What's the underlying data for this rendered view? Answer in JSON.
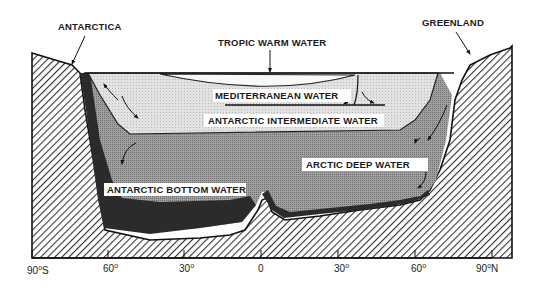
{
  "diagram": {
    "type": "ocean-circulation-cross-section",
    "landmasses": {
      "left": "ANTARCTICA",
      "right": "GREENLAND"
    },
    "water_masses": [
      {
        "id": "tropic",
        "label": "TROPIC WARM WATER"
      },
      {
        "id": "mediterranean",
        "label": "MEDITERRANEAN WATER"
      },
      {
        "id": "intermediate",
        "label": "ANTARCTIC INTERMEDIATE WATER"
      },
      {
        "id": "arctic_deep",
        "label": "ARCTIC DEEP WATER"
      },
      {
        "id": "antarctic_bottom",
        "label": "ANTARCTIC BOTTOM WATER"
      }
    ],
    "x_axis": {
      "ticks": [
        {
          "value": "90",
          "suffix": "S"
        },
        {
          "value": "60",
          "suffix": ""
        },
        {
          "value": "30",
          "suffix": ""
        },
        {
          "value": "0",
          "suffix": "",
          "no_degree": true
        },
        {
          "value": "30",
          "suffix": ""
        },
        {
          "value": "60",
          "suffix": ""
        },
        {
          "value": "90",
          "suffix": "N"
        }
      ],
      "degree_symbol": "o"
    },
    "colors": {
      "land_hatch": "#333333",
      "surface_water": "#e4e4e4",
      "intermediate_water": "#dcdcdc",
      "deep_water": "#8e8e8e",
      "bottom_water": "#2e2e2e",
      "label_bg": "#ffffff"
    }
  }
}
